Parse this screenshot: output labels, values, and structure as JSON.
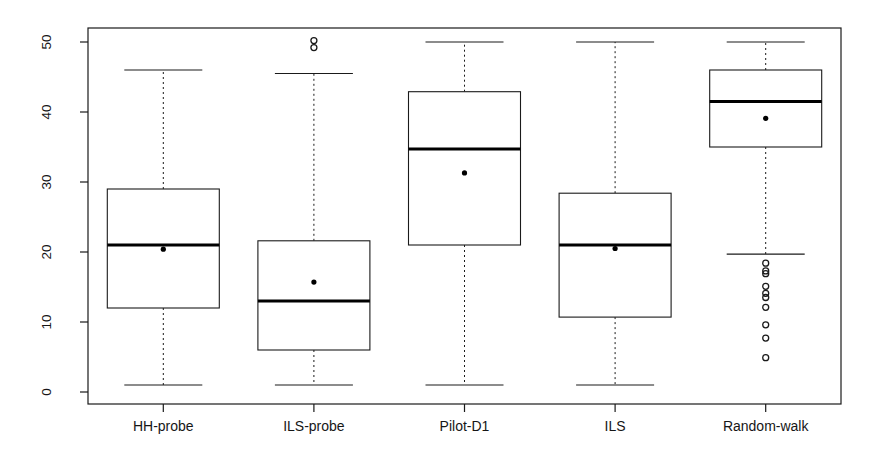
{
  "chart_data": {
    "type": "boxplot",
    "title": "",
    "xlabel": "",
    "ylabel": "Rank (over all runs per instance)",
    "ylim": [
      0,
      51.5
    ],
    "yticks": [
      0,
      10,
      20,
      30,
      40,
      50
    ],
    "ytick_labels": [
      "0",
      "10",
      "20",
      "30",
      "40",
      "50"
    ],
    "grid": false,
    "legend": null,
    "categories": [
      "HH-probe",
      "ILS-probe",
      "Pilot-D1",
      "ILS",
      "Random-walk"
    ],
    "boxes": [
      {
        "label": "HH-probe",
        "lower_whisker": 1,
        "q1": 12,
        "median": 21,
        "q3": 29,
        "upper_whisker": 46,
        "mean": 20.4,
        "outliers": []
      },
      {
        "label": "ILS-probe",
        "lower_whisker": 1,
        "q1": 6,
        "median": 13,
        "q3": 21.6,
        "upper_whisker": 45.5,
        "mean": 15.7,
        "outliers": [
          49.2,
          50.2
        ]
      },
      {
        "label": "Pilot-D1",
        "lower_whisker": 1,
        "q1": 21,
        "median": 34.7,
        "q3": 42.9,
        "upper_whisker": 50,
        "mean": 31.3,
        "outliers": []
      },
      {
        "label": "ILS",
        "lower_whisker": 1,
        "q1": 10.7,
        "median": 21,
        "q3": 28.4,
        "upper_whisker": 50,
        "mean": 20.5,
        "outliers": []
      },
      {
        "label": "Random-walk",
        "lower_whisker": 19.7,
        "q1": 35,
        "median": 41.5,
        "q3": 46,
        "upper_whisker": 50,
        "mean": 39.1,
        "outliers": [
          18.4,
          17.3,
          16.9,
          15.1,
          14.1,
          13.5,
          12.1,
          9.6,
          7.7,
          4.9
        ]
      }
    ]
  },
  "style": {
    "line_color": "#1a1a1a",
    "box_fill": "#ffffff",
    "median_color": "#000000",
    "mean_color": "#000000",
    "whisker_dash": "2,3",
    "background": "#ffffff"
  }
}
